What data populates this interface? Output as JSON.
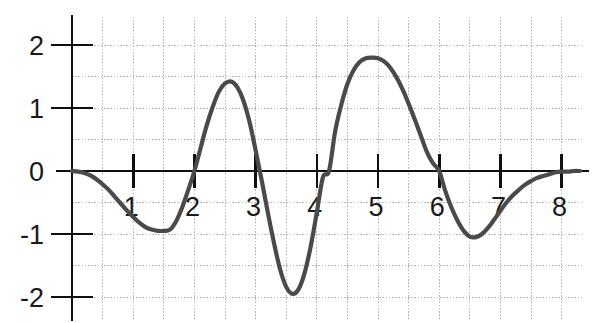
{
  "chart_data": {
    "type": "line",
    "title": "",
    "subtitle": "",
    "xlabel": "",
    "ylabel": "",
    "xlim": [
      0,
      8.35
    ],
    "ylim": [
      -2.35,
      2.45
    ],
    "grid": true,
    "grid_step_x": 0.5,
    "grid_step_y": 0.5,
    "legend": null,
    "legend_position": "none",
    "x_ticks": [
      1,
      2,
      3,
      4,
      5,
      6,
      7,
      8
    ],
    "x_tick_labels": [
      "1",
      "2",
      "3",
      "4",
      "5",
      "6",
      "7",
      "8"
    ],
    "y_ticks": [
      -2,
      -1,
      0,
      1,
      2
    ],
    "y_tick_labels": [
      "-2",
      "-1",
      "0",
      "1",
      "2"
    ],
    "curve_color": "#4a4a4a",
    "axis_color": "#101010",
    "grid_color": "#b9b9c4",
    "series": [
      {
        "name": "curve",
        "zero_crossings": [
          0.0,
          2.0,
          3.15,
          4.2,
          6.05,
          7.95
        ],
        "extrema": [
          {
            "x": 1.6,
            "y": -0.95,
            "kind": "minimum"
          },
          {
            "x": 2.6,
            "y": 1.42,
            "kind": "maximum"
          },
          {
            "x": 3.6,
            "y": -1.95,
            "kind": "minimum"
          },
          {
            "x": 4.95,
            "y": 1.8,
            "kind": "maximum"
          },
          {
            "x": 6.5,
            "y": -1.05,
            "kind": "minimum"
          }
        ],
        "x": [
          0.0,
          0.1,
          0.2,
          0.3,
          0.4,
          0.5,
          0.6,
          0.7,
          0.8,
          0.9,
          1.0,
          1.1,
          1.2,
          1.3,
          1.4,
          1.5,
          1.6,
          1.7,
          1.8,
          1.9,
          2.0,
          2.1,
          2.2,
          2.3,
          2.4,
          2.5,
          2.6,
          2.7,
          2.8,
          2.9,
          3.0,
          3.1,
          3.2,
          3.3,
          3.4,
          3.5,
          3.6,
          3.7,
          3.8,
          3.9,
          4.0,
          4.1,
          4.2,
          4.3,
          4.4,
          4.5,
          4.6,
          4.7,
          4.8,
          4.9,
          5.0,
          5.1,
          5.2,
          5.3,
          5.4,
          5.5,
          5.6,
          5.7,
          5.8,
          5.9,
          6.0,
          6.1,
          6.2,
          6.3,
          6.4,
          6.5,
          6.6,
          6.7,
          6.8,
          6.9,
          7.0,
          7.1,
          7.2,
          7.3,
          7.4,
          7.5,
          7.6,
          7.7,
          7.8,
          7.9,
          8.0,
          8.1,
          8.2,
          8.3
        ],
        "y": [
          0.0,
          -0.01,
          -0.03,
          -0.07,
          -0.13,
          -0.21,
          -0.3,
          -0.41,
          -0.52,
          -0.63,
          -0.73,
          -0.82,
          -0.89,
          -0.93,
          -0.95,
          -0.95,
          -0.93,
          -0.8,
          -0.58,
          -0.3,
          0.0,
          0.36,
          0.72,
          1.02,
          1.26,
          1.39,
          1.42,
          1.33,
          1.12,
          0.78,
          0.33,
          -0.15,
          -0.66,
          -1.14,
          -1.56,
          -1.84,
          -1.95,
          -1.88,
          -1.62,
          -1.2,
          -0.66,
          -0.1,
          0.0,
          0.63,
          1.05,
          1.38,
          1.6,
          1.73,
          1.79,
          1.8,
          1.79,
          1.74,
          1.64,
          1.49,
          1.3,
          1.07,
          0.82,
          0.56,
          0.3,
          0.12,
          0.0,
          -0.32,
          -0.58,
          -0.79,
          -0.95,
          -1.04,
          -1.05,
          -1.0,
          -0.9,
          -0.77,
          -0.63,
          -0.5,
          -0.39,
          -0.3,
          -0.22,
          -0.16,
          -0.11,
          -0.08,
          -0.05,
          -0.02,
          -0.01,
          -0.01,
          0.0,
          0.0
        ]
      }
    ]
  }
}
